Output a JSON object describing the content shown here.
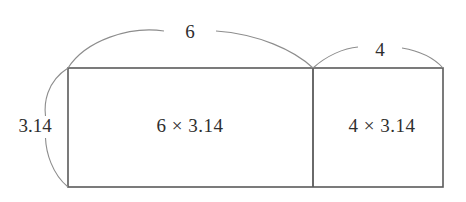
{
  "figure": {
    "type": "geometry-diagram",
    "colors": {
      "background": "#ffffff",
      "rectangle_stroke": "#5a5a5a",
      "brace_stroke": "#8d8d8d",
      "text": "#2e2e2e"
    },
    "labels": {
      "height": "3.14",
      "top_left_width": "6",
      "top_right_width": "4",
      "area_left": "6 × 3.14",
      "area_right": "4 × 3.14"
    },
    "geometry": {
      "rect_left_x": 68,
      "rect_right_x": 443,
      "rect_top_y": 68,
      "rect_bottom_y": 187,
      "divider_x": 313
    }
  }
}
